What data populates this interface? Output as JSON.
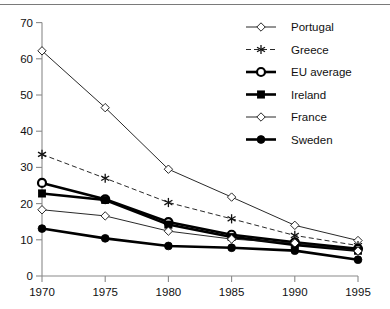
{
  "chart_data": {
    "type": "line",
    "title": "",
    "xlabel": "",
    "ylabel": "",
    "x": [
      1970,
      1975,
      1980,
      1985,
      1990,
      1995
    ],
    "xticklabels": [
      "1970",
      "1975",
      "1980",
      "1985",
      "1990",
      "1995"
    ],
    "yticklabels": [
      "0",
      "10",
      "20",
      "30",
      "40",
      "50",
      "60",
      "70"
    ],
    "yticks": [
      0,
      10,
      20,
      30,
      40,
      50,
      60,
      70
    ],
    "ylim": [
      0,
      70
    ],
    "xlim": [
      1970,
      1995
    ],
    "grid": false,
    "legend_position": "top-right",
    "series": [
      {
        "name": "Portugal",
        "values": [
          62.2,
          46.5,
          29.5,
          21.8,
          14.0,
          9.8
        ],
        "marker": "open-diamond",
        "line": "thin-solid",
        "color": "#111111"
      },
      {
        "name": "Greece",
        "values": [
          33.6,
          27.0,
          20.3,
          15.8,
          11.2,
          8.4
        ],
        "marker": "star",
        "line": "thin-dashed",
        "color": "#111111"
      },
      {
        "name": "EU average",
        "values": [
          25.7,
          21.2,
          14.9,
          11.4,
          9.3,
          7.5
        ],
        "marker": "open-circle-bold",
        "line": "thick-solid",
        "color": "#000000"
      },
      {
        "name": "Ireland",
        "values": [
          22.8,
          21.0,
          14.2,
          10.8,
          8.6,
          7.0
        ],
        "marker": "filled-square",
        "line": "thick-solid",
        "color": "#000000"
      },
      {
        "name": "France",
        "values": [
          18.3,
          16.6,
          12.4,
          10.2,
          9.1,
          6.9
        ],
        "marker": "open-diamond",
        "line": "thin-solid",
        "color": "#111111"
      },
      {
        "name": "Sweden",
        "values": [
          13.1,
          10.4,
          8.3,
          7.8,
          7.0,
          4.5
        ],
        "marker": "filled-circle",
        "line": "thick-solid",
        "color": "#000000"
      }
    ]
  },
  "legend": {
    "entries": [
      {
        "label": "Portugal"
      },
      {
        "label": "Greece"
      },
      {
        "label": "EU average"
      },
      {
        "label": "Ireland"
      },
      {
        "label": "France"
      },
      {
        "label": "Sweden"
      }
    ]
  }
}
